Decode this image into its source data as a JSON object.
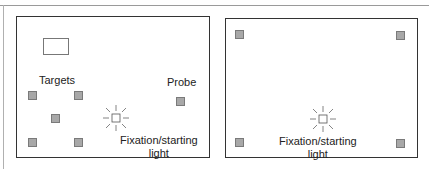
{
  "figure": {
    "left_panel": {
      "labels": {
        "targets": "Targets",
        "probe": "Probe",
        "fixation_line1": "Fixation/starting",
        "fixation_line2": "light"
      }
    },
    "right_panel": {
      "labels": {
        "fixation_line1": "Fixation/starting",
        "fixation_line2": "light"
      }
    },
    "colors": {
      "target_fill": "#a8a8a8",
      "target_stroke": "#7a7a7a",
      "panel_border": "#333333"
    }
  }
}
